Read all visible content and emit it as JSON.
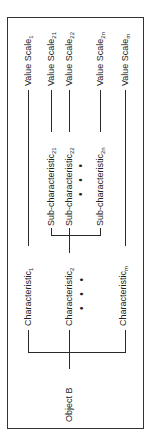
{
  "diagram": {
    "root": {
      "label": "Object B"
    },
    "characteristics": [
      {
        "label": "Characteristic",
        "subscript": "1",
        "value_scale": {
          "label": "Value Scale",
          "subscript": "1"
        }
      },
      {
        "label": "Characteristic",
        "subscript": "2",
        "sub_characteristics": [
          {
            "label": "Sub-characteristic",
            "subscript": "21",
            "value_scale": {
              "label": "Value Scale",
              "subscript": "21"
            }
          },
          {
            "label": "Sub-characteristic",
            "subscript": "22",
            "value_scale": {
              "label": "Value Scale",
              "subscript": "22"
            }
          },
          {
            "label": "Sub-characteristic",
            "subscript": "2n",
            "value_scale": {
              "label": "Value Scale",
              "subscript": "2n"
            }
          }
        ],
        "ellipsis": "• • •"
      },
      {
        "label": "Characteristic",
        "subscript": "m",
        "value_scale": {
          "label": "Value Scale",
          "subscript": "m"
        }
      }
    ],
    "ellipsis": "• • •"
  }
}
